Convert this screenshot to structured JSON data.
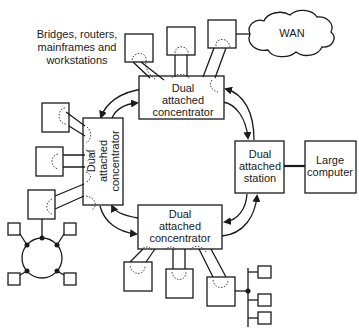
{
  "diagram": {
    "caption_label": "Bridges, routers, mainframes and workstations",
    "caption_lines": [
      "Bridges, routers,",
      "mainframes and",
      "workstations"
    ],
    "nodes": {
      "top_concentrator": {
        "lines": [
          "Dual",
          "attached",
          "concentrator"
        ]
      },
      "left_concentrator": {
        "lines": [
          "Dual",
          "attached",
          "concentrator"
        ]
      },
      "bottom_concentrator": {
        "lines": [
          "Dual",
          "attached",
          "concentrator"
        ]
      },
      "station": {
        "lines": [
          "Dual",
          "attached",
          "station"
        ]
      },
      "large_computer": {
        "lines": [
          "Large",
          "computer"
        ]
      },
      "wan": {
        "label": "WAN"
      }
    },
    "edges": [
      {
        "from": "top_concentrator",
        "to": "left_concentrator",
        "type": "dual-ring"
      },
      {
        "from": "top_concentrator",
        "to": "station",
        "type": "dual-ring"
      },
      {
        "from": "station",
        "to": "bottom_concentrator",
        "type": "dual-ring"
      },
      {
        "from": "bottom_concentrator",
        "to": "left_concentrator",
        "type": "dual-ring"
      },
      {
        "from": "station",
        "to": "large_computer",
        "type": "link"
      },
      {
        "from": "top_concentrator",
        "to": "wan",
        "type": "via-attached-device"
      }
    ],
    "attached_devices": {
      "top": 3,
      "left": 3,
      "bottom": 3
    },
    "subnetworks": [
      {
        "type": "ring",
        "terminals": 4,
        "attached_to": "left_concentrator"
      },
      {
        "type": "bus",
        "terminals": 3,
        "attached_to": "bottom_concentrator"
      }
    ]
  }
}
